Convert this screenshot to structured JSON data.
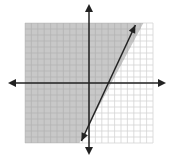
{
  "graph": {
    "title": "Graph of linear inequality y ≥ 2x − 7",
    "inequality": "y ≥ 2x − 7",
    "boundary_line": {
      "slope": 2,
      "intercept": -7,
      "style": "solid"
    },
    "shaded_side": "left/above line",
    "x_range": [
      -10,
      10
    ],
    "y_range": [
      -10,
      10
    ],
    "grid_step": 1,
    "colors": {
      "background": "#ffffff",
      "shade": "#c8c8c8",
      "grid_light": "#d4d4d4",
      "grid_on_shade": "#b4b4b4",
      "axis": "#222222",
      "line": "#222222"
    }
  },
  "chart_data": {
    "type": "line",
    "title": "",
    "xlabel": "",
    "ylabel": "",
    "xlim": [
      -10,
      10
    ],
    "ylim": [
      -10,
      10
    ],
    "grid": true,
    "series": [
      {
        "name": "y = 2x - 7",
        "x": [
          -1.5,
          8.5
        ],
        "y": [
          -10,
          10
        ]
      }
    ],
    "shading": "y >= 2x - 7"
  }
}
